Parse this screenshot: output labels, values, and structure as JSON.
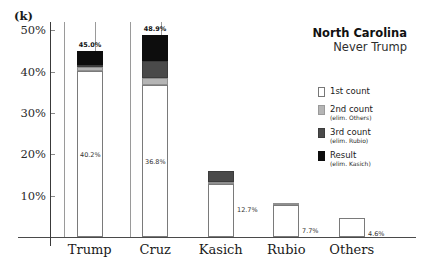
{
  "chart_data": {
    "type": "bar",
    "title": "North Carolina",
    "subtitle": "Never Trump",
    "unit_label": "(k)",
    "xlabel": "",
    "ylabel": "",
    "ylim": [
      0,
      52
    ],
    "grid": false,
    "stacked": true,
    "categories": [
      "Trump",
      "Cruz",
      "Kasich",
      "Rubio",
      "Others"
    ],
    "ytick_labels": [
      "10%",
      "20%",
      "30%",
      "40%",
      "50%"
    ],
    "ytick_values": [
      10,
      20,
      30,
      40,
      50
    ],
    "series": [
      {
        "name": "1st count",
        "note": "",
        "color": "#ffffff",
        "values": [
          40.2,
          36.8,
          12.7,
          7.7,
          4.6
        ]
      },
      {
        "name": "2nd count",
        "note": "(elim. Others)",
        "color": "#b5b5b5",
        "values": [
          0.9,
          1.7,
          0.6,
          0.5,
          0.0
        ]
      },
      {
        "name": "3rd count",
        "note": "(elim. Rubio)",
        "color": "#4a4a4a",
        "values": [
          0.6,
          4.1,
          2.6,
          0.0,
          0.0
        ]
      },
      {
        "name": "Result",
        "note": "(elim. Kasich)",
        "color": "#0d0d0d",
        "values": [
          3.3,
          6.3,
          0.0,
          0.0,
          0.0
        ]
      }
    ],
    "total_labels": [
      "45.0%",
      "48.9%",
      "",
      "",
      ""
    ],
    "base_labels": [
      "40.2%",
      "36.8%",
      "12.7%",
      "7.7%",
      "4.6%"
    ]
  },
  "legend": {
    "position": "right",
    "items": [
      {
        "label": "1st count",
        "note": "",
        "swatch": "first"
      },
      {
        "label": "2nd count",
        "note": "(elim. Others)",
        "swatch": "second"
      },
      {
        "label": "3rd count",
        "note": "(elim. Rubio)",
        "swatch": "third"
      },
      {
        "label": "Result",
        "note": "(elim. Kasich)",
        "swatch": "result"
      }
    ]
  }
}
